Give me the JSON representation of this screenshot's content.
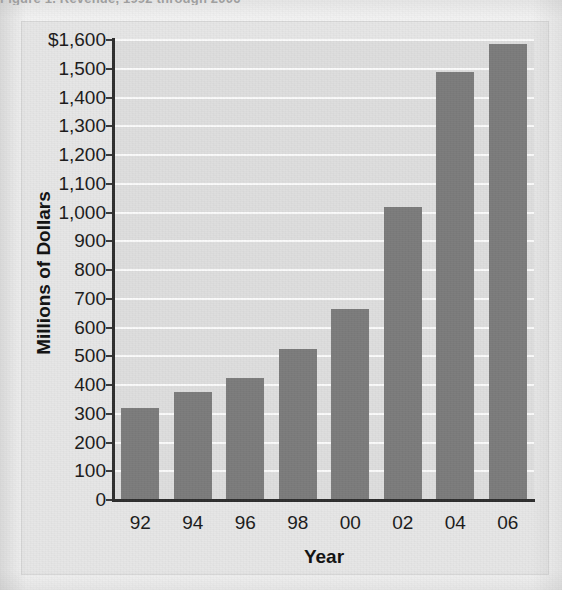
{
  "caption_sliver": "Figure 1.  Revenue, 1992 through 2006",
  "colors": {
    "bar": "#7c7c7c",
    "plot_background": "#dedede",
    "frame_background": "#e6e6e6",
    "gridline": "#fbfbfb",
    "axis": "#2e2e2e",
    "text": "#1b1b1b"
  },
  "chart_data": {
    "type": "bar",
    "title": "",
    "xlabel": "Year",
    "ylabel": "Millions of Dollars",
    "categories": [
      "92",
      "94",
      "96",
      "98",
      "00",
      "02",
      "04",
      "06"
    ],
    "values": [
      320,
      375,
      425,
      525,
      665,
      1020,
      1490,
      1585
    ],
    "ylim": [
      0,
      1600
    ],
    "ytick_step": 100,
    "ytick_labels": [
      "0",
      "100",
      "200",
      "300",
      "400",
      "500",
      "600",
      "700",
      "800",
      "900",
      "1,000",
      "1,100",
      "1,200",
      "1,300",
      "1,400",
      "1,500",
      "$1,600"
    ],
    "ytick_values": [
      0,
      100,
      200,
      300,
      400,
      500,
      600,
      700,
      800,
      900,
      1000,
      1100,
      1200,
      1300,
      1400,
      1500,
      1600
    ],
    "grid": true,
    "grid_axis": "y",
    "legend": null,
    "legend_position": "none",
    "series": [
      {
        "name": "Millions of Dollars",
        "values": [
          320,
          375,
          425,
          525,
          665,
          1020,
          1490,
          1585
        ]
      }
    ]
  }
}
